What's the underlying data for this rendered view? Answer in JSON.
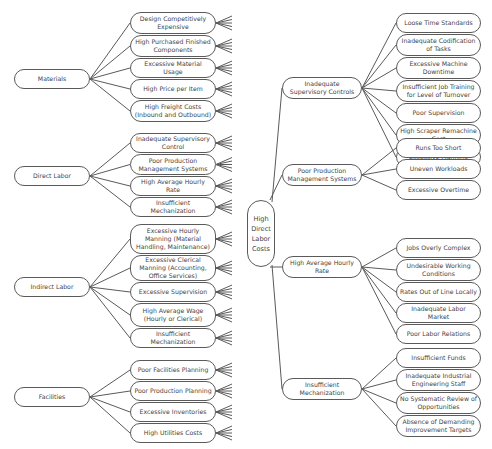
{
  "root": {
    "label": "High Direct Labor Costs",
    "lines": [
      "High",
      "Direct",
      "Labor",
      "Costs"
    ]
  },
  "left": [
    {
      "label": "Materials",
      "children": [
        "Design Competitively Expensive",
        "High Purchased Finished Components",
        "Excessive Material Usage",
        "High Price per Item",
        "High Freight Costs (Inbound and Outbound)"
      ]
    },
    {
      "label": "Direct Labor",
      "children": [
        "Inadequate Supervisory Control",
        "Poor Production Management Systems",
        "High Average Hourly Rate",
        "Insufficient Mechanization"
      ]
    },
    {
      "label": "Indirect Labor",
      "children": [
        "Excessive Hourly Manning (Material Handling, Maintenance)",
        "Excessive Clerical Manning (Accounting, Office Services)",
        "Excessive Supervision",
        "High Average Wage (Hourly or Clerical)",
        "Insufficient Mechanization"
      ]
    },
    {
      "label": "Facilities",
      "children": [
        "Poor Facilities Planning",
        "Poor Production Planning",
        "Excessive Inventories",
        "High Utilities Costs"
      ]
    }
  ],
  "right": [
    {
      "label": "Inadequate Supervisory Controls",
      "children": [
        "Loose Time Standards",
        "Inadequate Codification of Tasks",
        "Excessive Machine Downtime",
        "Insufficient Job Training for Level of Turnover",
        "Poor Supervision",
        "High Scraper Remachine Cost",
        "Excessive Manning"
      ]
    },
    {
      "label": "Poor Production Management Systems",
      "children": [
        "Runs Too Short",
        "Uneven Workloads",
        "Excessive Overtime"
      ]
    },
    {
      "label": "High Average Hourly Rate",
      "children": [
        "Jobs Overly Complex",
        "Undesirable Working Conditions",
        "Rates Out of Line Locally",
        "Inadequate Labor Market",
        "Poor Labor Relations"
      ]
    },
    {
      "label": "Insufficient Mechanization",
      "children": [
        "Insufficient Funds",
        "Inadequate Industrial Engineering Staff",
        "No Systematic Review of Opportunities",
        "Absence of Demanding Improvement Targets"
      ]
    }
  ],
  "colors": {
    "stroke": "#5a5a5a",
    "text": "#444444",
    "background": "#ffffff"
  }
}
